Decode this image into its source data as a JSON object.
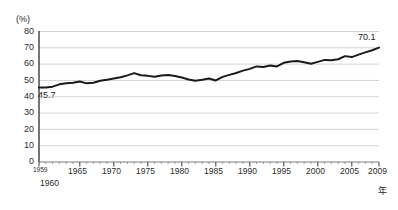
{
  "chart_data": {
    "type": "line",
    "title": "",
    "subtitle": "",
    "xlabel": "年",
    "ylabel": "(%)",
    "ylim": [
      0,
      80
    ],
    "xlim": [
      1959,
      2009
    ],
    "grid": true,
    "legend": null,
    "ytick_labels": [
      "80",
      "70",
      "60",
      "50",
      "40",
      "30",
      "20",
      "10",
      "0"
    ],
    "ytick_values": [
      80,
      70,
      60,
      50,
      40,
      30,
      20,
      10,
      0
    ],
    "xtick_labels": [
      "1959",
      "1960",
      "1965",
      "1970",
      "1975",
      "1980",
      "1985",
      "1990",
      "1995",
      "2000",
      "2005",
      "2009"
    ],
    "xtick_values": [
      1959,
      1960,
      1965,
      1970,
      1975,
      1980,
      1985,
      1990,
      1995,
      2000,
      2005,
      2009
    ],
    "annotations": [
      {
        "text": "45.7",
        "x": 1959,
        "y": 45.7
      },
      {
        "text": "70.1",
        "x": 2009,
        "y": 70.1
      }
    ],
    "series": [
      {
        "name": "",
        "color": "#1a1a1a",
        "x": [
          1959,
          1960,
          1961,
          1962,
          1963,
          1964,
          1965,
          1966,
          1967,
          1968,
          1969,
          1970,
          1971,
          1972,
          1973,
          1974,
          1975,
          1976,
          1977,
          1978,
          1979,
          1980,
          1981,
          1982,
          1983,
          1984,
          1985,
          1986,
          1987,
          1988,
          1989,
          1990,
          1991,
          1992,
          1993,
          1994,
          1995,
          1996,
          1997,
          1998,
          1999,
          2000,
          2001,
          2002,
          2003,
          2004,
          2005,
          2006,
          2007,
          2008,
          2009
        ],
        "values": [
          45.7,
          45.6,
          46.2,
          47.6,
          48.3,
          48.6,
          49.4,
          48.2,
          48.6,
          49.8,
          50.4,
          51.2,
          52.0,
          53.1,
          54.5,
          53.2,
          52.8,
          52.2,
          53.0,
          53.3,
          52.7,
          51.8,
          50.6,
          49.8,
          50.4,
          51.2,
          50.0,
          52.2,
          53.4,
          54.6,
          56.0,
          57.1,
          58.6,
          58.3,
          59.2,
          58.6,
          60.8,
          61.6,
          61.9,
          61.1,
          60.2,
          61.4,
          62.6,
          62.4,
          63.0,
          64.9,
          64.3,
          65.8,
          67.2,
          68.5,
          70.1
        ]
      }
    ]
  }
}
